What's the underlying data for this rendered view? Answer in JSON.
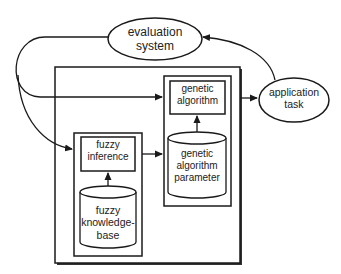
{
  "diagram": {
    "nodes": {
      "evaluation_system": {
        "lines": [
          "evaluation",
          "system"
        ],
        "shape": "ellipse"
      },
      "application_task": {
        "lines": [
          "application",
          "task"
        ],
        "shape": "ellipse"
      },
      "genetic_algorithm": {
        "lines": [
          "genetic",
          "algorithm"
        ],
        "shape": "rectangle"
      },
      "genetic_algorithm_parameter": {
        "lines": [
          "genetic",
          "algorithm",
          "parameter"
        ],
        "shape": "cylinder"
      },
      "fuzzy_inference": {
        "lines": [
          "fuzzy",
          "inference"
        ],
        "shape": "rectangle"
      },
      "fuzzy_knowledge_base": {
        "lines": [
          "fuzzy",
          "knowledge-",
          "base"
        ],
        "shape": "cylinder"
      }
    },
    "edges": [
      {
        "from": "evaluation_system",
        "to": "genetic_algorithm"
      },
      {
        "from": "evaluation_system",
        "to": "fuzzy_inference"
      },
      {
        "from": "application_task",
        "to": "evaluation_system"
      },
      {
        "from": "genetic_algorithm",
        "to": "application_task"
      },
      {
        "from": "fuzzy_inference",
        "to": "genetic_algorithm_parameter"
      },
      {
        "from": "genetic_algorithm_parameter",
        "to": "genetic_algorithm"
      },
      {
        "from": "fuzzy_knowledge_base",
        "to": "fuzzy_inference"
      }
    ],
    "colors": {
      "stroke": "#1a1a1a",
      "background": "#ffffff"
    }
  }
}
